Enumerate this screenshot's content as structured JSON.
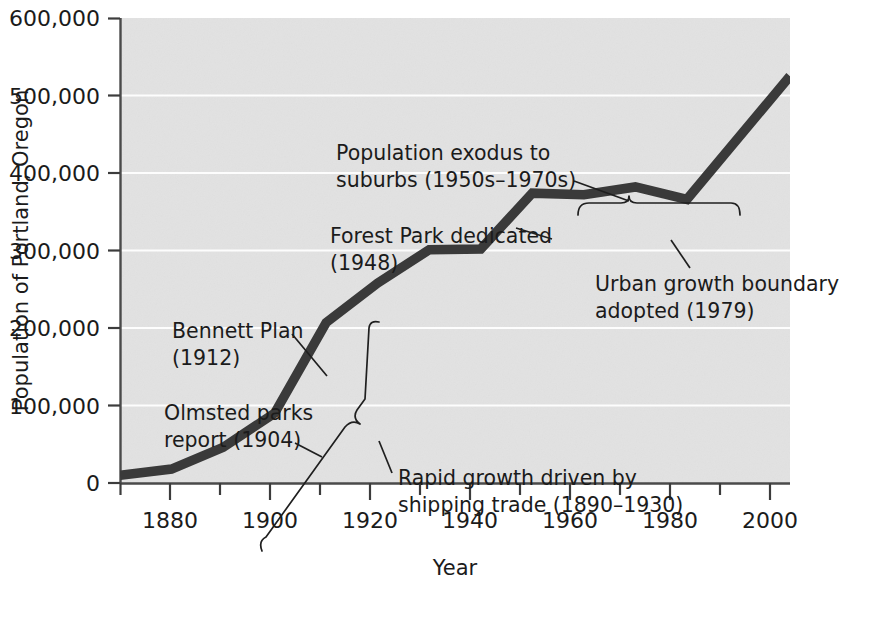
{
  "chart_data": {
    "type": "line",
    "title": "",
    "xlabel": "Year",
    "ylabel": "Population of Portland, Oregon",
    "xlim": [
      1870,
      2000
    ],
    "ylim": [
      0,
      600000
    ],
    "grid": true,
    "legend": "none",
    "x_ticks": [
      "1880",
      "1900",
      "1920",
      "1940",
      "1960",
      "1980",
      "2000"
    ],
    "x_tick_values": [
      1880,
      1900,
      1920,
      1940,
      1960,
      1980,
      2000
    ],
    "x_minor_tick_values": [
      1870,
      1890,
      1910,
      1930,
      1950,
      1970,
      1990
    ],
    "y_ticks": [
      "0",
      "100,000",
      "200,000",
      "300,000",
      "400,000",
      "500,000",
      "600,000"
    ],
    "y_tick_values": [
      0,
      100000,
      200000,
      300000,
      400000,
      500000,
      600000
    ],
    "series": [
      {
        "name": "Population of Portland, Oregon",
        "x": [
          1870,
          1880,
          1890,
          1900,
          1910,
          1920,
          1930,
          1940,
          1950,
          1960,
          1970,
          1980,
          2000
        ],
        "values": [
          10000,
          18000,
          46000,
          90000,
          207000,
          258000,
          301000,
          302000,
          374000,
          372000,
          382000,
          366000,
          525000
        ],
        "color": "#3a3a3a"
      }
    ],
    "annotations": [
      {
        "id": "population-exodus",
        "line1": "Population exodus to",
        "line2": "suburbs (1950s–1970s)",
        "target": "brace spanning 1950–1980 above the plateau"
      },
      {
        "id": "forest-park",
        "line1": "Forest Park dedicated",
        "line2": "(1948)",
        "target": "1950 vertex of the line"
      },
      {
        "id": "urban-growth-boundary",
        "line1": "Urban growth boundary",
        "line2": "adopted (1979)",
        "target": "1980 vertex of the line"
      },
      {
        "id": "bennett-plan",
        "line1": "Bennett Plan",
        "line2": "(1912)",
        "target": "1910 vertex of the line"
      },
      {
        "id": "olmsted-parks",
        "line1": "Olmsted parks",
        "line2": "report (1904)",
        "target": "line segment near 1904"
      },
      {
        "id": "rapid-growth",
        "line1": "Rapid growth driven by",
        "line2": "shipping trade (1890–1930)",
        "target": "diagonal brace along the 1890–1930 rise"
      }
    ],
    "colors": {
      "plot_background": "#e2e2e2",
      "gridline": "#fdfdfd",
      "data_line": "#3a3a3a",
      "text": "#1b1b1b",
      "page_background": "#ffffff"
    }
  }
}
